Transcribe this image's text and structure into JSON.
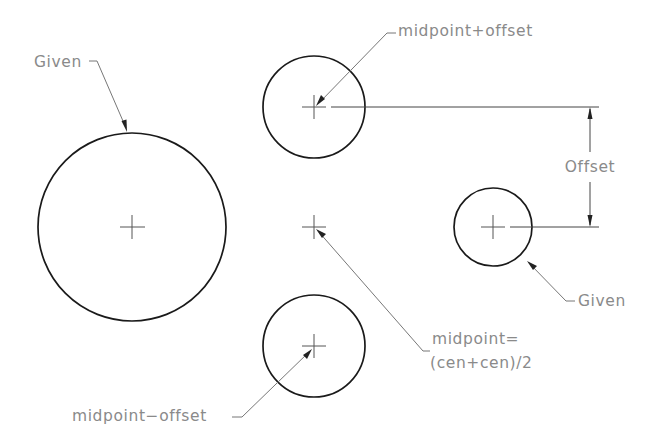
{
  "diagram": {
    "type": "cad-construction-diagram",
    "colors": {
      "background": "#ffffff",
      "circle_stroke": "#1a1a1a",
      "label_text": "#8a8a8a",
      "leader_line": "#777777"
    },
    "circles": [
      {
        "id": "given-large",
        "cx": 132,
        "cy": 227,
        "r": 94
      },
      {
        "id": "midpoint-plus-offset",
        "cx": 314,
        "cy": 107,
        "r": 51
      },
      {
        "id": "midpoint-minus-offset",
        "cx": 314,
        "cy": 346,
        "r": 51
      },
      {
        "id": "given-small",
        "cx": 493,
        "cy": 227,
        "r": 39
      }
    ],
    "center_marks": [
      {
        "id": "given-large-center",
        "x": 132,
        "y": 227
      },
      {
        "id": "top-center",
        "x": 314,
        "y": 107
      },
      {
        "id": "midpoint",
        "x": 314,
        "y": 227
      },
      {
        "id": "bottom-center",
        "x": 314,
        "y": 346
      },
      {
        "id": "given-small-center",
        "x": 493,
        "y": 227
      }
    ],
    "labels": {
      "given_left": "Given",
      "midpoint_plus_offset": "midpoint+offset",
      "offset": "Offset",
      "given_right": "Given",
      "midpoint_eq_line1": "midpoint=",
      "midpoint_eq_line2": "(cen+cen)/2",
      "midpoint_minus_offset": "midpoint−offset"
    },
    "dimension": {
      "label": "Offset",
      "x": 590,
      "y_top": 107,
      "y_bottom": 227
    }
  }
}
